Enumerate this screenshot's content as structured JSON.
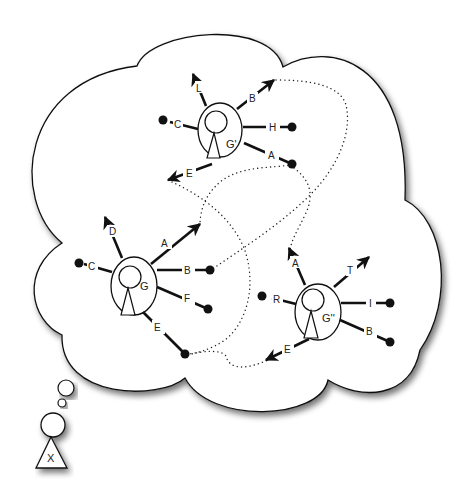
{
  "diagram": {
    "type": "thought-bubble network diagram",
    "thinker": {
      "label": "X"
    },
    "nodes": [
      {
        "id": "G-prime",
        "label": "G'",
        "ports": [
          {
            "label": "L",
            "kind": "arrow-out"
          },
          {
            "label": "B",
            "kind": "arrow-out"
          },
          {
            "label": "C",
            "kind": "dot"
          },
          {
            "label": "H",
            "kind": "dot"
          },
          {
            "label": "A",
            "kind": "dot"
          },
          {
            "label": "E",
            "kind": "arrow-out"
          }
        ]
      },
      {
        "id": "G",
        "label": "G",
        "ports": [
          {
            "label": "D",
            "kind": "arrow-out"
          },
          {
            "label": "A",
            "kind": "arrow-out"
          },
          {
            "label": "C",
            "kind": "dot"
          },
          {
            "label": "B",
            "kind": "dot"
          },
          {
            "label": "F",
            "kind": "dot"
          },
          {
            "label": "E",
            "kind": "dot"
          }
        ]
      },
      {
        "id": "G-double-prime",
        "label": "G''",
        "ports": [
          {
            "label": "A",
            "kind": "arrow-out"
          },
          {
            "label": "T",
            "kind": "arrow-out"
          },
          {
            "label": "R",
            "kind": "dot"
          },
          {
            "label": "I",
            "kind": "dot"
          },
          {
            "label": "B",
            "kind": "dot"
          },
          {
            "label": "E",
            "kind": "arrow-out"
          }
        ]
      }
    ],
    "connections": [
      {
        "from": "G'.A",
        "to": "G.A"
      },
      {
        "from": "G'.E",
        "to": "G.E"
      },
      {
        "from": "G'.B",
        "to": "G.B"
      },
      {
        "from": "G'.A",
        "to": "G''.A"
      },
      {
        "from": "G.E",
        "to": "G''.E"
      }
    ]
  },
  "labels": {
    "gp": {
      "node": "G'",
      "L": "L",
      "B": "B",
      "C": "C",
      "H": "H",
      "A": "A",
      "E": "E"
    },
    "g": {
      "node": "G",
      "D": "D",
      "A": "A",
      "C": "C",
      "B": "B",
      "F": "F",
      "E": "E"
    },
    "gpp": {
      "node": "G''",
      "A": "A",
      "T": "T",
      "R": "R",
      "I": "I",
      "B": "B",
      "E": "E"
    },
    "thinker": "X"
  },
  "colors": {
    "ink": "#111111",
    "background": "#ffffff",
    "shadow": "#888888"
  }
}
